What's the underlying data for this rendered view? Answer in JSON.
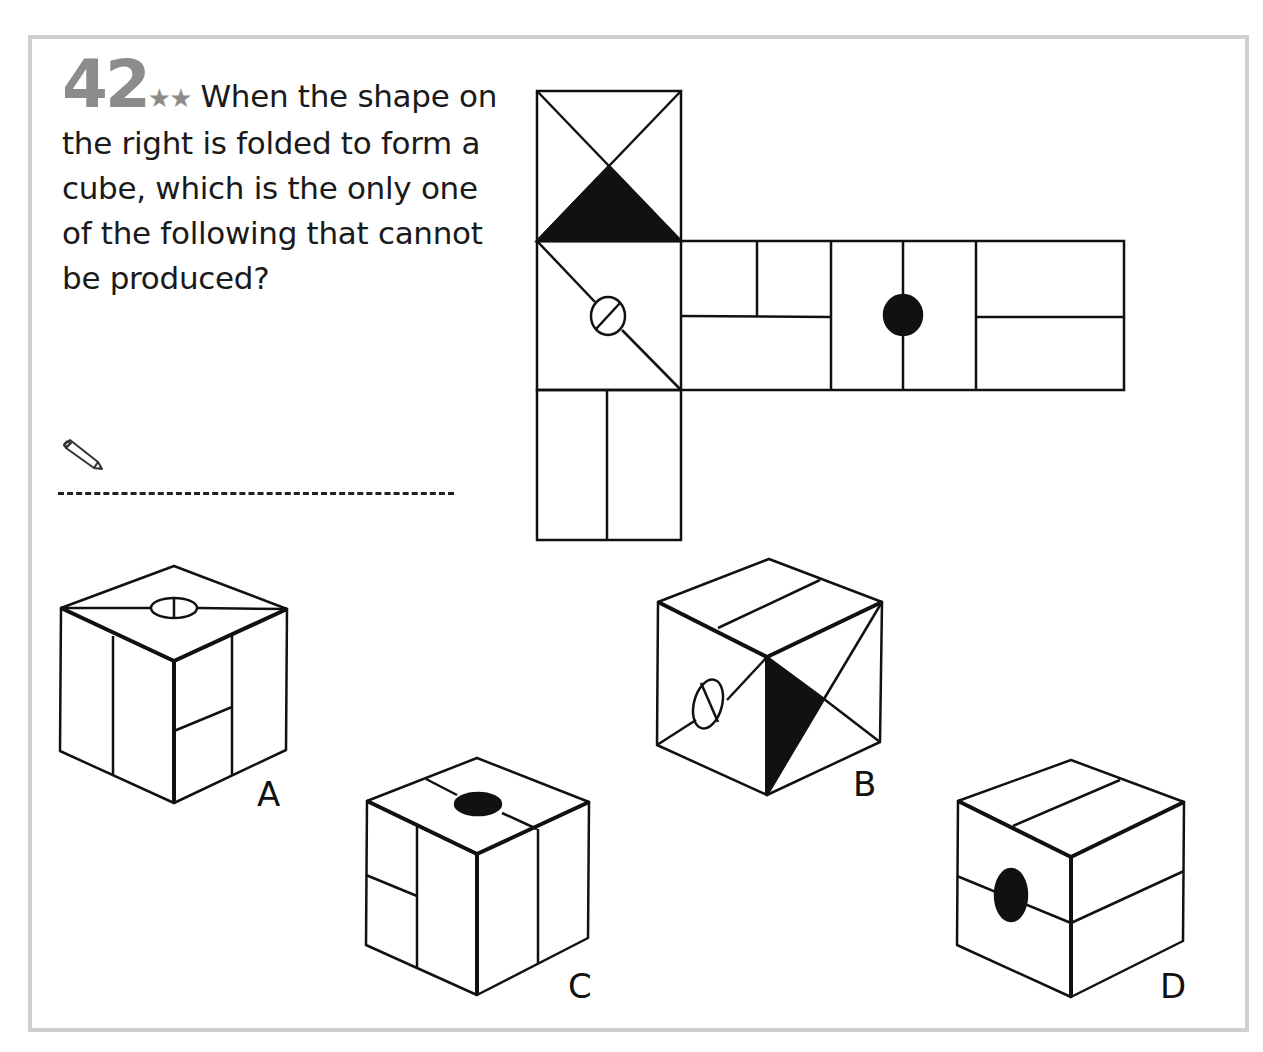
{
  "puzzle": {
    "number": "42",
    "difficulty_stars": "★★",
    "question": "When the shape on the right is folded to form a cube, which is the only one of the following that cannot be produced?",
    "icons": {
      "pencil": "pencil-icon"
    }
  },
  "net": {
    "description": "cube net: top face with X diagonals and black lower triangle; middle row of four faces; bottom face split vertically",
    "faces": [
      {
        "id": "top",
        "pattern": "x-diagonals-black-bottom-triangle"
      },
      {
        "id": "left-middle",
        "pattern": "diagonal-with-slotted-circle"
      },
      {
        "id": "middle-2",
        "pattern": "horizontal-split-with-upper-vertical-divider"
      },
      {
        "id": "middle-3",
        "pattern": "vertical-line-with-black-dot"
      },
      {
        "id": "middle-4",
        "pattern": "horizontal-split"
      },
      {
        "id": "bottom",
        "pattern": "vertical-split"
      }
    ]
  },
  "options": [
    {
      "label": "A"
    },
    {
      "label": "B"
    },
    {
      "label": "C"
    },
    {
      "label": "D"
    }
  ]
}
